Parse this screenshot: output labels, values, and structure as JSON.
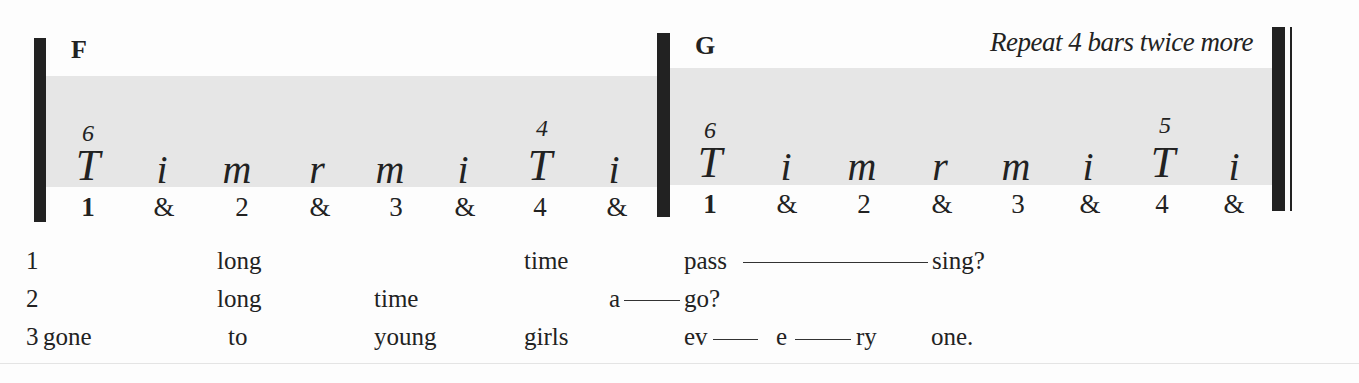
{
  "bars": [
    {
      "chord": "F",
      "notes": [
        {
          "finger": "T",
          "string": "6",
          "count": "1"
        },
        {
          "finger": "i",
          "string": "",
          "count": "&"
        },
        {
          "finger": "m",
          "string": "",
          "count": "2"
        },
        {
          "finger": "r",
          "string": "",
          "count": "&"
        },
        {
          "finger": "m",
          "string": "",
          "count": "3"
        },
        {
          "finger": "i",
          "string": "",
          "count": "&"
        },
        {
          "finger": "T",
          "string": "4",
          "count": "4"
        },
        {
          "finger": "i",
          "string": "",
          "count": "&"
        }
      ]
    },
    {
      "chord": "G",
      "instruction": "Repeat 4 bars twice more",
      "notes": [
        {
          "finger": "T",
          "string": "6",
          "count": "1"
        },
        {
          "finger": "i",
          "string": "",
          "count": "&"
        },
        {
          "finger": "m",
          "string": "",
          "count": "2"
        },
        {
          "finger": "r",
          "string": "",
          "count": "&"
        },
        {
          "finger": "m",
          "string": "",
          "count": "3"
        },
        {
          "finger": "i",
          "string": "",
          "count": "&"
        },
        {
          "finger": "T",
          "string": "5",
          "count": "4"
        },
        {
          "finger": "i",
          "string": "",
          "count": "&"
        }
      ]
    }
  ],
  "lyrics": [
    {
      "verse": "1",
      "words": [
        "long",
        "time",
        "pass",
        "sing?"
      ]
    },
    {
      "verse": "2",
      "words": [
        "long",
        "time",
        "a",
        "go?"
      ]
    },
    {
      "verse": "3",
      "words": [
        "gone",
        "to",
        "young",
        "girls",
        "ev",
        "e",
        "ry",
        "one."
      ]
    }
  ]
}
